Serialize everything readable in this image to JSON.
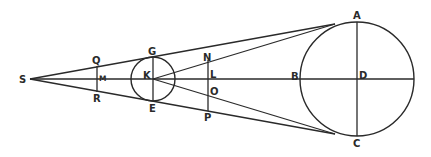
{
  "diagram": {
    "labels": {
      "S": "S",
      "Q": "Q",
      "M": "M",
      "R": "R",
      "G": "G",
      "K": "K",
      "E": "E",
      "N": "N",
      "L": "L",
      "O": "O",
      "P": "P",
      "B": "B",
      "D": "D",
      "A": "A",
      "C": "C"
    },
    "colors": {
      "stroke": "#2a2a2a",
      "background": "#ffffff"
    }
  }
}
